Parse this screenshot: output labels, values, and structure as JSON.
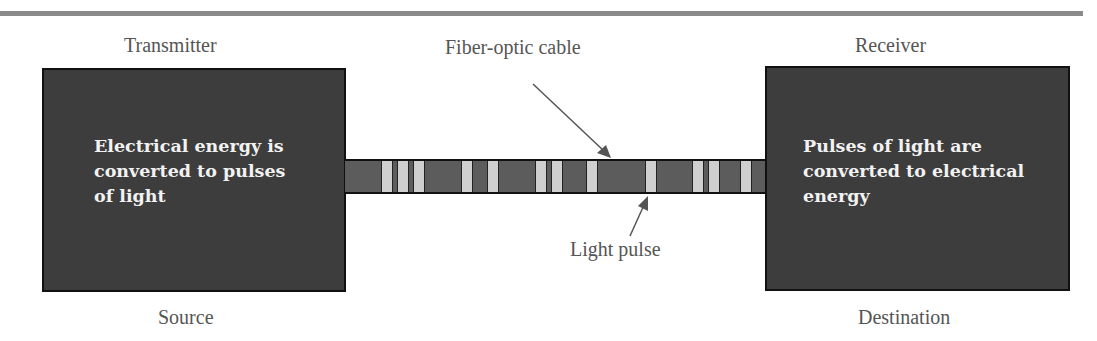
{
  "diagram": {
    "title_rule": true,
    "transmitter": {
      "top_label": "Transmitter",
      "bottom_label": "Source",
      "text": [
        "Electrical energy is",
        "converted to pulses",
        "of light"
      ]
    },
    "receiver": {
      "top_label": "Receiver",
      "bottom_label": "Destination",
      "text": [
        "Pulses of light are",
        "converted to electrical",
        "energy"
      ]
    },
    "cable": {
      "label": "Fiber-optic cable",
      "pulse_label": "Light pulse",
      "pulses_x": [
        36,
        52,
        68,
        116,
        142,
        190,
        206,
        241,
        300,
        347,
        363,
        395
      ]
    },
    "colors": {
      "box_fill": "#3d3d3d",
      "cable_fill": "#5c5c5c",
      "pulse_fill": "#cfcfcf",
      "label_text": "#555555",
      "box_text": "#f2f2f2"
    }
  }
}
